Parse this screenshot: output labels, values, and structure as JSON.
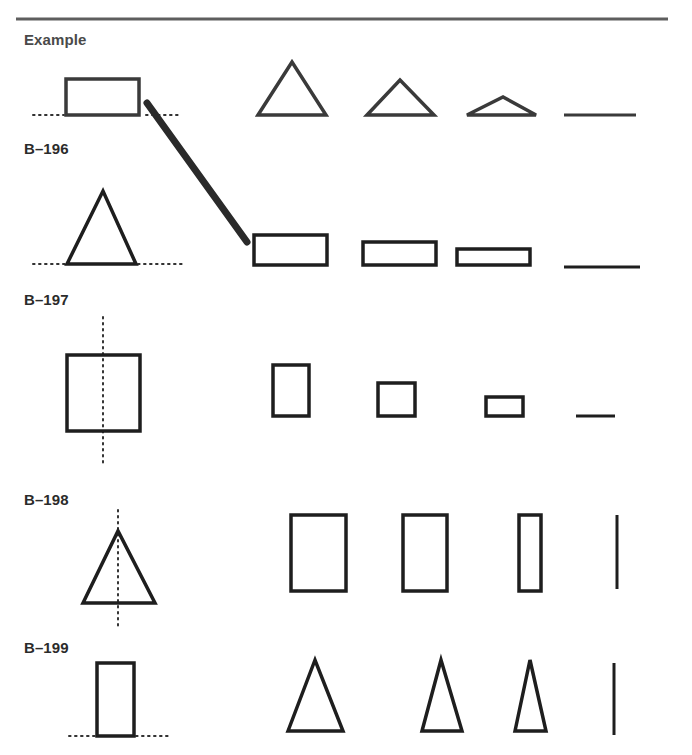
{
  "page": {
    "rule": {
      "x1": 16,
      "x2": 668,
      "y": 19,
      "color": "#5e5e5e",
      "width": 3
    }
  },
  "colors": {
    "stroke": "#1e1e1e",
    "example_stroke": "#3a3a3a",
    "dotted": "#333333",
    "pencil": "#2a2a2a"
  },
  "rows": [
    {
      "id": "example",
      "label": "Example",
      "label_pos": {
        "x": 24,
        "y": 31
      },
      "original": {
        "type": "rect",
        "x": 66,
        "y": 79,
        "w": 73,
        "h": 36
      },
      "guide": {
        "type": "horizontal-dotted",
        "segments": [
          [
            33,
            64,
            115
          ],
          [
            146,
            182,
            115
          ]
        ]
      },
      "sequence": [
        {
          "type": "triangle",
          "points": [
            [
              258,
              115
            ],
            [
              292,
              62
            ],
            [
              326,
              115
            ]
          ]
        },
        {
          "type": "triangle",
          "points": [
            [
              367,
              115
            ],
            [
              400,
              80
            ],
            [
              434,
              115
            ]
          ]
        },
        {
          "type": "triangle",
          "points": [
            [
              467,
              115
            ],
            [
              503,
              97
            ],
            [
              536,
              115
            ]
          ]
        },
        {
          "type": "line",
          "points": [
            [
              564,
              115
            ],
            [
              636,
              115
            ]
          ]
        }
      ]
    },
    {
      "id": "b-196",
      "label": "B–196",
      "label_pos": {
        "x": 24,
        "y": 140
      },
      "original": {
        "type": "triangle",
        "points": [
          [
            67,
            264
          ],
          [
            103,
            191
          ],
          [
            136,
            264
          ]
        ]
      },
      "guide": {
        "type": "horizontal-dotted",
        "segments": [
          [
            33,
            65,
            264
          ],
          [
            138,
            182,
            264
          ]
        ]
      },
      "sequence": [
        {
          "type": "rect",
          "x": 254,
          "y": 235,
          "w": 73,
          "h": 30
        },
        {
          "type": "rect",
          "x": 363,
          "y": 242,
          "w": 73,
          "h": 23
        },
        {
          "type": "rect",
          "x": 457,
          "y": 249,
          "w": 73,
          "h": 16
        },
        {
          "type": "line",
          "points": [
            [
              564,
              267
            ],
            [
              640,
              267
            ]
          ]
        }
      ]
    },
    {
      "id": "b-197",
      "label": "B–197",
      "label_pos": {
        "x": 24,
        "y": 291
      },
      "original": {
        "type": "rect",
        "x": 67,
        "y": 355,
        "w": 73,
        "h": 76
      },
      "guide": {
        "type": "vertical-dotted",
        "segments": [
          [
            103,
            317,
            466
          ]
        ]
      },
      "sequence": [
        {
          "type": "rect",
          "x": 273,
          "y": 365,
          "w": 36,
          "h": 51
        },
        {
          "type": "rect",
          "x": 378,
          "y": 383,
          "w": 37,
          "h": 33
        },
        {
          "type": "rect",
          "x": 486,
          "y": 397,
          "w": 37,
          "h": 19
        },
        {
          "type": "line",
          "points": [
            [
              576,
              416
            ],
            [
              615,
              416
            ]
          ]
        }
      ]
    },
    {
      "id": "b-198",
      "label": "B–198",
      "label_pos": {
        "x": 24,
        "y": 491
      },
      "original": {
        "type": "triangle",
        "points": [
          [
            83,
            603
          ],
          [
            118,
            531
          ],
          [
            155,
            603
          ]
        ]
      },
      "guide": {
        "type": "vertical-dotted",
        "segments": [
          [
            118,
            510,
            627
          ]
        ]
      },
      "sequence": [
        {
          "type": "rect",
          "x": 291,
          "y": 515,
          "w": 55,
          "h": 76
        },
        {
          "type": "rect",
          "x": 403,
          "y": 515,
          "w": 44,
          "h": 76
        },
        {
          "type": "rect",
          "x": 519,
          "y": 515,
          "w": 22,
          "h": 76
        },
        {
          "type": "line",
          "points": [
            [
              617,
              515
            ],
            [
              617,
              589
            ]
          ]
        }
      ]
    },
    {
      "id": "b-199",
      "label": "B–199",
      "label_pos": {
        "x": 24,
        "y": 639
      },
      "original": {
        "type": "rect",
        "x": 97,
        "y": 663,
        "w": 37,
        "h": 73
      },
      "guide": {
        "type": "horizontal-dotted",
        "segments": [
          [
            69,
            96,
            736
          ],
          [
            136,
            172,
            736
          ]
        ]
      },
      "sequence": [
        {
          "type": "triangle",
          "points": [
            [
              288,
              731
            ],
            [
              315,
              660
            ],
            [
              343,
              731
            ]
          ]
        },
        {
          "type": "triangle",
          "points": [
            [
              422,
              731
            ],
            [
              441,
              660
            ],
            [
              462,
              731
            ]
          ]
        },
        {
          "type": "triangle",
          "points": [
            [
              515,
              731
            ],
            [
              530,
              660
            ],
            [
              546,
              731
            ]
          ]
        },
        {
          "type": "line",
          "points": [
            [
              614,
              663
            ],
            [
              614,
              735
            ]
          ]
        }
      ]
    }
  ],
  "pencil_stroke": {
    "from": [
      147,
      103
    ],
    "to": [
      247,
      242
    ],
    "width": 7
  }
}
